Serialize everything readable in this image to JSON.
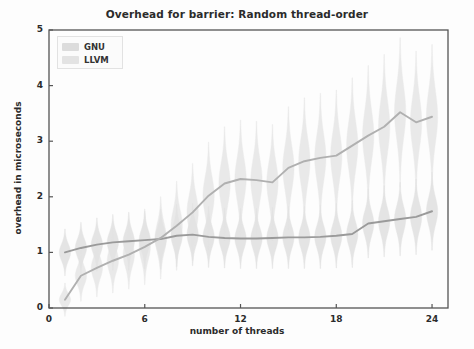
{
  "chart_data": {
    "type": "line",
    "title": "Overhead for barrier: Random thread-order",
    "xlabel": "number of threads",
    "ylabel": "overhead in microseconds",
    "xlim": [
      0,
      25
    ],
    "ylim": [
      0,
      5
    ],
    "xticks": [
      0,
      6,
      12,
      18,
      24
    ],
    "yticks": [
      0,
      1,
      2,
      3,
      4,
      5
    ],
    "xtick_labels": [
      "0",
      "6",
      "12",
      "18",
      "24"
    ],
    "ytick_labels": [
      "0",
      "1",
      "2",
      "3",
      "4",
      "5"
    ],
    "grid": false,
    "legend_position": "upper left",
    "overlay": "violin distributions per thread count with mean trend lines",
    "x": [
      1,
      2,
      3,
      4,
      5,
      6,
      7,
      8,
      9,
      10,
      11,
      12,
      13,
      14,
      15,
      16,
      17,
      18,
      19,
      20,
      21,
      22,
      23,
      24
    ],
    "series": [
      {
        "name": "GNU",
        "color": "#a9a9a9",
        "values": [
          1.0,
          1.08,
          1.14,
          1.18,
          1.2,
          1.22,
          1.24,
          1.3,
          1.32,
          1.28,
          1.26,
          1.25,
          1.25,
          1.26,
          1.27,
          1.27,
          1.28,
          1.3,
          1.33,
          1.52,
          1.56,
          1.6,
          1.64,
          1.74
        ],
        "violin_spread": [
          0.42,
          0.46,
          0.48,
          0.5,
          0.52,
          0.52,
          0.54,
          0.56,
          0.56,
          0.55,
          0.54,
          0.54,
          0.54,
          0.55,
          0.56,
          0.56,
          0.57,
          0.58,
          0.6,
          0.62,
          0.64,
          0.66,
          0.68,
          0.7
        ]
      },
      {
        "name": "LLVM",
        "color": "#b4b4b4",
        "values": [
          0.15,
          0.58,
          0.72,
          0.85,
          0.96,
          1.1,
          1.26,
          1.48,
          1.72,
          2.02,
          2.24,
          2.32,
          2.3,
          2.26,
          2.52,
          2.64,
          2.7,
          2.74,
          2.92,
          3.1,
          3.26,
          3.52,
          3.34,
          3.44
        ],
        "violin_spread": [
          0.3,
          0.46,
          0.52,
          0.58,
          0.62,
          0.68,
          0.74,
          0.8,
          0.88,
          0.96,
          1.02,
          1.06,
          1.06,
          1.04,
          1.1,
          1.14,
          1.16,
          1.18,
          1.22,
          1.26,
          1.3,
          1.34,
          1.28,
          1.3
        ]
      }
    ]
  },
  "legend": {
    "entries": [
      {
        "label": "GNU"
      },
      {
        "label": "LLVM"
      }
    ]
  },
  "colors": {
    "gnu_line": "#9a9a9a",
    "llvm_line": "#b0b0b0",
    "gnu_violin": "#dcdcdc",
    "llvm_violin": "#e3e3e3",
    "axis": "#555555",
    "text": "#2b2b2b"
  }
}
